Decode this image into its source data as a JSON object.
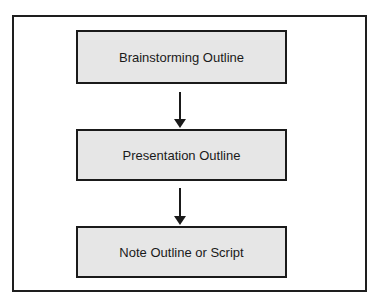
{
  "diagram": {
    "type": "flowchart",
    "direction": "top-to-bottom",
    "nodes": [
      {
        "id": "n1",
        "label": "Brainstorming Outline"
      },
      {
        "id": "n2",
        "label": "Presentation Outline"
      },
      {
        "id": "n3",
        "label": "Note Outline or Script"
      }
    ],
    "edges": [
      {
        "from": "n1",
        "to": "n2"
      },
      {
        "from": "n2",
        "to": "n3"
      }
    ],
    "colors": {
      "box_fill": "#e6e6e6",
      "stroke": "#1a1a1a",
      "background": "#ffffff"
    }
  }
}
